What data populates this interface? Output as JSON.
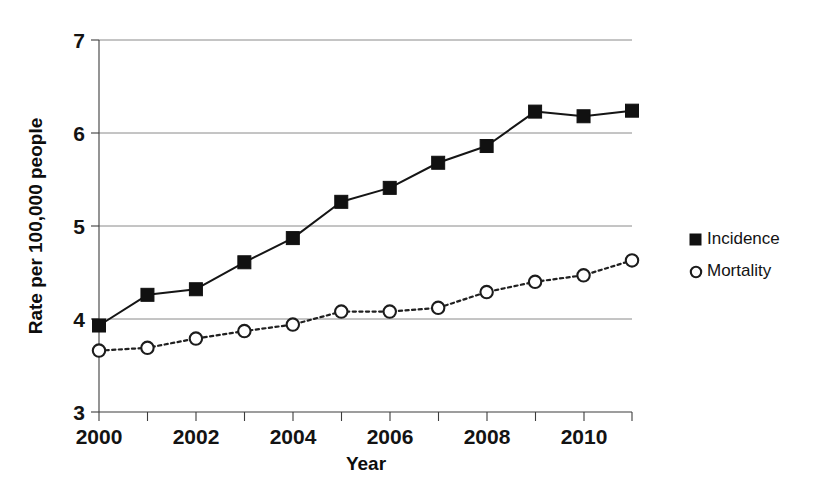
{
  "chart_data": {
    "type": "line",
    "title": "",
    "subtitle": "",
    "xlabel": "Year",
    "ylabel": "Rate per 100,000 people",
    "x": [
      2000,
      2001,
      2002,
      2003,
      2004,
      2005,
      2006,
      2007,
      2008,
      2009,
      2010,
      2011
    ],
    "categories": [
      "2000",
      "2001",
      "2002",
      "2003",
      "2004",
      "2005",
      "2006",
      "2007",
      "2008",
      "2009",
      "2010",
      "2011"
    ],
    "series": [
      {
        "name": "Incidence",
        "marker": "filled-square",
        "linestyle": "solid",
        "color": "#111111",
        "values": [
          3.93,
          4.26,
          4.32,
          4.61,
          4.87,
          5.26,
          5.41,
          5.68,
          5.86,
          6.23,
          6.18,
          6.24
        ]
      },
      {
        "name": "Mortality",
        "marker": "open-circle",
        "linestyle": "dotted",
        "color": "#1c1c1c",
        "values": [
          3.66,
          3.69,
          3.79,
          3.87,
          3.94,
          4.08,
          4.08,
          4.12,
          4.29,
          4.4,
          4.47,
          4.63
        ]
      }
    ],
    "xlim": [
      2000,
      2011
    ],
    "ylim": [
      3,
      7
    ],
    "y_ticks": [
      3,
      4,
      5,
      6,
      7
    ],
    "y_tick_labels": [
      "3",
      "4",
      "5",
      "6",
      "7"
    ],
    "x_ticks": [
      2000,
      2001,
      2002,
      2003,
      2004,
      2005,
      2006,
      2007,
      2008,
      2009,
      2010,
      2011
    ],
    "x_tick_labels_shown": [
      "2000",
      "2002",
      "2004",
      "2006",
      "2008",
      "2010"
    ],
    "x_tick_labels_positions": [
      2000,
      2002,
      2004,
      2006,
      2008,
      2010
    ],
    "grid": "horizontal",
    "legend_position": "right",
    "legend": [
      {
        "label": "Incidence",
        "marker": "filled-square"
      },
      {
        "label": "Mortality",
        "marker": "open-circle"
      }
    ]
  },
  "axes": {
    "y_title": "Rate per 100,000 people",
    "x_title": "Year",
    "y_labels": [
      "7",
      "6",
      "5",
      "4",
      "3"
    ],
    "x_labels": [
      "2000",
      "2002",
      "2004",
      "2006",
      "2008",
      "2010"
    ]
  },
  "legend": {
    "incidence_label": "Incidence",
    "mortality_label": "Mortality"
  },
  "colors": {
    "incidence": "#111111",
    "mortality": "#1c1c1c",
    "grid": "#8a8a8a",
    "axis": "#3d3d3d",
    "background": "#ffffff"
  }
}
